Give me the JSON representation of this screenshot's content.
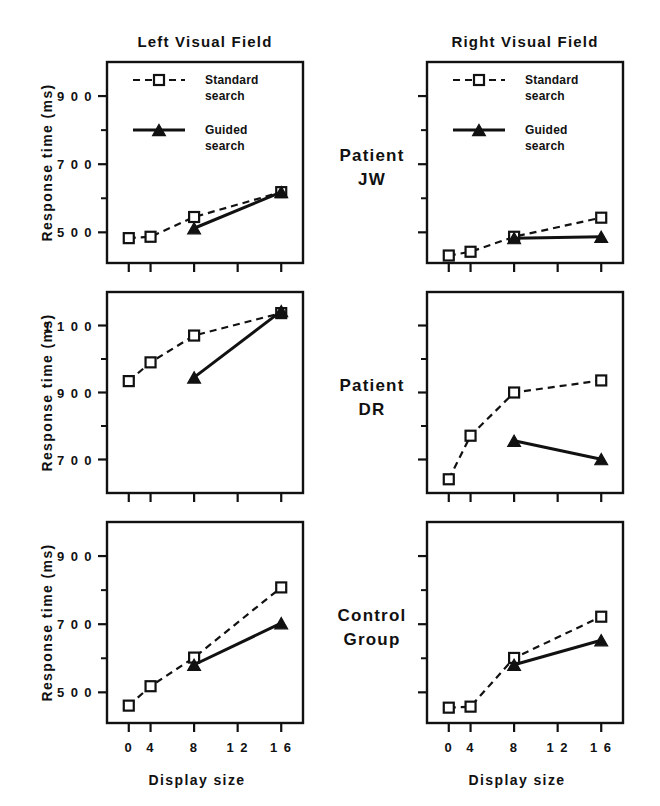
{
  "figure": {
    "column_titles": [
      "Left  Visual  Field",
      "Right  Visual  Field"
    ],
    "row_labels": [
      "Patient\nJW",
      "Patient\nDR",
      "Control\nGroup"
    ],
    "row_labels_flat": [
      "Patient JW",
      "Patient DR",
      "Control Group"
    ],
    "row_label_lines": [
      [
        "Patient",
        "JW"
      ],
      [
        "Patient",
        "DR"
      ],
      [
        "Control",
        "Group"
      ]
    ],
    "y_axis_title": "Response  time  (ms)",
    "x_axis_title": "Display   size",
    "legend": [
      {
        "label_line1": "Standard",
        "label_line2": "search",
        "style": "dashed",
        "marker": "open-square"
      },
      {
        "label_line1": "Guided",
        "label_line2": "search",
        "style": "solid",
        "marker": "filled-triangle"
      }
    ],
    "colors": {
      "ink": "#111111",
      "paper": "#ffffff"
    }
  },
  "chart_data": {
    "type": "line",
    "title": "",
    "xlabel": "Display size",
    "ylabel": "Response time (ms)",
    "x": [
      2,
      4,
      8,
      16
    ],
    "xlim": [
      0,
      18
    ],
    "x_ticks": [
      2,
      4,
      8,
      12,
      16
    ],
    "x_tick_labels": [
      "0",
      "4",
      "8",
      "1 2",
      "1 6"
    ],
    "grid": false,
    "legend_position": "top-left inside panel row 1",
    "panels": [
      {
        "row_label": "Patient JW",
        "column": "Left Visual Field",
        "ylim": [
          410,
          1000
        ],
        "y_ticks_major": [
          500,
          700,
          900
        ],
        "y_tick_labels": [
          "5 0 0",
          "7 0 0",
          "9 0 0"
        ],
        "y_ticks_minor": [
          600,
          800
        ],
        "y_labels_visible": true,
        "series": [
          {
            "name": "Standard search",
            "x": [
              2,
              4,
              8,
              16
            ],
            "values": [
              483,
              487,
              545,
              618
            ]
          },
          {
            "name": "Guided search",
            "x": [
              8,
              16
            ],
            "values": [
              512,
              618
            ]
          }
        ]
      },
      {
        "row_label": "Patient JW",
        "column": "Right Visual Field",
        "ylim": [
          410,
          1000
        ],
        "y_ticks_major": [
          500,
          700,
          900
        ],
        "y_tick_labels": [],
        "y_ticks_minor": [
          600,
          800
        ],
        "y_labels_visible": false,
        "series": [
          {
            "name": "Standard search",
            "x": [
              2,
              4,
              8,
              16
            ],
            "values": [
              432,
              443,
              487,
              543
            ]
          },
          {
            "name": "Guided search",
            "x": [
              8,
              16
            ],
            "values": [
              483,
              487
            ]
          }
        ]
      },
      {
        "row_label": "Patient DR",
        "column": "Left Visual Field",
        "ylim": [
          600,
          1200
        ],
        "y_ticks_major": [
          700,
          900,
          1100
        ],
        "y_tick_labels": [
          "7 0 0",
          "9 0 0",
          "1 1 0 0"
        ],
        "y_ticks_minor": [
          800,
          1000
        ],
        "y_labels_visible": true,
        "series": [
          {
            "name": "Standard search",
            "x": [
              2,
              4,
              8,
              16
            ],
            "values": [
              934,
              990,
              1070,
              1137
            ]
          },
          {
            "name": "Guided search",
            "x": [
              8,
              16
            ],
            "values": [
              945,
              1143
            ]
          }
        ]
      },
      {
        "row_label": "Patient DR",
        "column": "Right Visual Field",
        "ylim": [
          600,
          1200
        ],
        "y_ticks_major": [
          700,
          900,
          1100
        ],
        "y_tick_labels": [],
        "y_ticks_minor": [
          800,
          1000
        ],
        "y_labels_visible": false,
        "series": [
          {
            "name": "Standard search",
            "x": [
              2,
              4,
              8,
              16
            ],
            "values": [
              641,
              771,
              900,
              936
            ]
          },
          {
            "name": "Guided search",
            "x": [
              8,
              16
            ],
            "values": [
              756,
              701
            ]
          }
        ]
      },
      {
        "row_label": "Control Group",
        "column": "Left Visual Field",
        "ylim": [
          410,
          1000
        ],
        "y_ticks_major": [
          500,
          700,
          900
        ],
        "y_tick_labels": [
          "5 0 0",
          "7 0 0",
          "9 0 0"
        ],
        "y_ticks_minor": [
          600,
          800
        ],
        "y_labels_visible": true,
        "series": [
          {
            "name": "Standard search",
            "x": [
              2,
              4,
              8,
              16
            ],
            "values": [
              461,
              518,
              602,
              808
            ]
          },
          {
            "name": "Guided search",
            "x": [
              8,
              16
            ],
            "values": [
              581,
              703
            ]
          }
        ]
      },
      {
        "row_label": "Control Group",
        "column": "Right Visual Field",
        "ylim": [
          410,
          1000
        ],
        "y_ticks_major": [
          500,
          700,
          900
        ],
        "y_tick_labels": [],
        "y_ticks_minor": [
          600,
          800
        ],
        "y_labels_visible": false,
        "series": [
          {
            "name": "Standard search",
            "x": [
              2,
              4,
              8,
              16
            ],
            "values": [
              455,
              458,
              601,
              722
            ]
          },
          {
            "name": "Guided search",
            "x": [
              8,
              16
            ],
            "values": [
              581,
              653
            ]
          }
        ]
      }
    ]
  }
}
